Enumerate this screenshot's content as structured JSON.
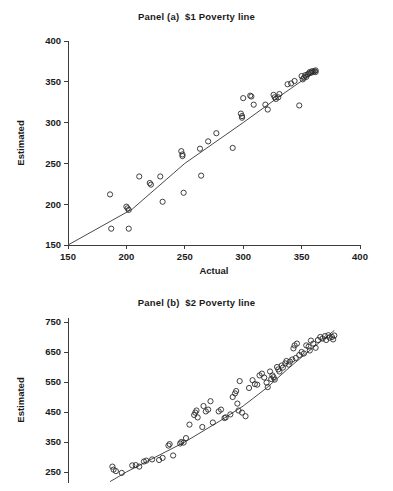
{
  "figure": {
    "background": "#ffffff",
    "ink": "#1a1a1a"
  },
  "panel_a": {
    "title": "Panel (a)  $1 Poverty line",
    "ylabel": "Estimated",
    "xlabel": "Actual",
    "y_ticks": [
      "400",
      "350",
      "300",
      "250",
      "200",
      "150"
    ],
    "x_ticks": [
      "150",
      "200",
      "250",
      "300",
      "350",
      "400"
    ]
  },
  "panel_b": {
    "title": "Panel (b)  $2 Poverty line",
    "ylabel": "Estimated",
    "xlabel": "",
    "y_ticks": [
      "750",
      "650",
      "550",
      "450",
      "350",
      "250"
    ],
    "x_ticks": []
  },
  "chart_data": [
    {
      "type": "scatter",
      "title": "Panel (a)  $1 Poverty line",
      "xlabel": "Actual",
      "ylabel": "Estimated",
      "xlim": [
        150,
        400
      ],
      "ylim": [
        150,
        400
      ],
      "xticks": [
        150,
        200,
        250,
        300,
        350,
        400
      ],
      "yticks": [
        150,
        200,
        250,
        300,
        350,
        400
      ],
      "grid": false,
      "legend": null,
      "marker": "open-circle",
      "marker_color": "#2b2b2b",
      "fit_line": {
        "label": "fitted line",
        "color": "#4a4a4a",
        "points": [
          [
            150,
            150
          ],
          [
            205,
            194
          ],
          [
            250,
            250
          ],
          [
            300,
            300
          ],
          [
            330,
            331
          ],
          [
            362,
            363
          ]
        ]
      },
      "points": [
        [
          186,
          212
        ],
        [
          187,
          170
        ],
        [
          200,
          197
        ],
        [
          201,
          195
        ],
        [
          202,
          193
        ],
        [
          202,
          170
        ],
        [
          211,
          234
        ],
        [
          220,
          226
        ],
        [
          221,
          224
        ],
        [
          229,
          234
        ],
        [
          231,
          203
        ],
        [
          247,
          265
        ],
        [
          248,
          261
        ],
        [
          248,
          259
        ],
        [
          249,
          214
        ],
        [
          263,
          268
        ],
        [
          264,
          235
        ],
        [
          270,
          277
        ],
        [
          277,
          287
        ],
        [
          291,
          269
        ],
        [
          298,
          311
        ],
        [
          299,
          308
        ],
        [
          299,
          306
        ],
        [
          300,
          330
        ],
        [
          306,
          333
        ],
        [
          307,
          332
        ],
        [
          309,
          322
        ],
        [
          319,
          322
        ],
        [
          321,
          316
        ],
        [
          326,
          334
        ],
        [
          327,
          331
        ],
        [
          328,
          329
        ],
        [
          330,
          331
        ],
        [
          331,
          335
        ],
        [
          338,
          347
        ],
        [
          341,
          348
        ],
        [
          344,
          351
        ],
        [
          348,
          321
        ],
        [
          350,
          357
        ],
        [
          351,
          353
        ],
        [
          352,
          355
        ],
        [
          353,
          358
        ],
        [
          354,
          356
        ],
        [
          355,
          359
        ],
        [
          356,
          360
        ],
        [
          357,
          362
        ],
        [
          358,
          361
        ],
        [
          359,
          363
        ],
        [
          360,
          362
        ],
        [
          361,
          363
        ],
        [
          362,
          364
        ],
        [
          362,
          362
        ]
      ]
    },
    {
      "type": "scatter",
      "title": "Panel (b)  $2 Poverty line",
      "xlabel": "",
      "ylabel": "Estimated",
      "xlim": [
        150,
        400
      ],
      "ylim": [
        215,
        765
      ],
      "xticks": [],
      "yticks": [
        250,
        350,
        450,
        550,
        650,
        750
      ],
      "grid": false,
      "legend": null,
      "marker": "open-circle",
      "marker_color": "#2b2b2b",
      "fit_line": {
        "label": "fitted line",
        "color": "#4a4a4a",
        "points": [
          [
            186,
            218
          ],
          [
            200,
            250
          ],
          [
            220,
            290
          ],
          [
            250,
            350
          ],
          [
            280,
            420
          ],
          [
            300,
            470
          ],
          [
            320,
            530
          ],
          [
            340,
            600
          ],
          [
            360,
            665
          ],
          [
            378,
            722
          ]
        ]
      },
      "points": [
        [
          188,
          268
        ],
        [
          189,
          258
        ],
        [
          191,
          253
        ],
        [
          196,
          247
        ],
        [
          205,
          272
        ],
        [
          208,
          273
        ],
        [
          211,
          268
        ],
        [
          215,
          285
        ],
        [
          217,
          288
        ],
        [
          222,
          292
        ],
        [
          228,
          290
        ],
        [
          231,
          297
        ],
        [
          236,
          338
        ],
        [
          237,
          343
        ],
        [
          240,
          305
        ],
        [
          246,
          345
        ],
        [
          247,
          350
        ],
        [
          249,
          348
        ],
        [
          251,
          363
        ],
        [
          254,
          408
        ],
        [
          258,
          440
        ],
        [
          259,
          448
        ],
        [
          260,
          455
        ],
        [
          261,
          432
        ],
        [
          265,
          400
        ],
        [
          266,
          470
        ],
        [
          268,
          452
        ],
        [
          270,
          458
        ],
        [
          272,
          486
        ],
        [
          274,
          415
        ],
        [
          279,
          452
        ],
        [
          281,
          458
        ],
        [
          284,
          430
        ],
        [
          285,
          432
        ],
        [
          289,
          442
        ],
        [
          291,
          500
        ],
        [
          293,
          512
        ],
        [
          294,
          520
        ],
        [
          295,
          478
        ],
        [
          296,
          455
        ],
        [
          297,
          553
        ],
        [
          299,
          448
        ],
        [
          302,
          436
        ],
        [
          305,
          530
        ],
        [
          308,
          556
        ],
        [
          310,
          543
        ],
        [
          312,
          541
        ],
        [
          314,
          572
        ],
        [
          316,
          578
        ],
        [
          318,
          565
        ],
        [
          320,
          548
        ],
        [
          321,
          533
        ],
        [
          323,
          585
        ],
        [
          324,
          560
        ],
        [
          325,
          572
        ],
        [
          326,
          566
        ],
        [
          327,
          558
        ],
        [
          329,
          600
        ],
        [
          330,
          592
        ],
        [
          331,
          585
        ],
        [
          333,
          605
        ],
        [
          334,
          598
        ],
        [
          336,
          612
        ],
        [
          337,
          620
        ],
        [
          339,
          608
        ],
        [
          340,
          618
        ],
        [
          342,
          625
        ],
        [
          343,
          662
        ],
        [
          344,
          672
        ],
        [
          345,
          630
        ],
        [
          346,
          678
        ],
        [
          348,
          640
        ],
        [
          350,
          650
        ],
        [
          352,
          645
        ],
        [
          354,
          672
        ],
        [
          356,
          668
        ],
        [
          357,
          655
        ],
        [
          358,
          688
        ],
        [
          360,
          678
        ],
        [
          362,
          664
        ],
        [
          364,
          690
        ],
        [
          366,
          700
        ],
        [
          368,
          695
        ],
        [
          370,
          703
        ],
        [
          371,
          690
        ],
        [
          373,
          706
        ],
        [
          374,
          698
        ],
        [
          376,
          700
        ],
        [
          377,
          692
        ],
        [
          378,
          705
        ]
      ]
    }
  ]
}
